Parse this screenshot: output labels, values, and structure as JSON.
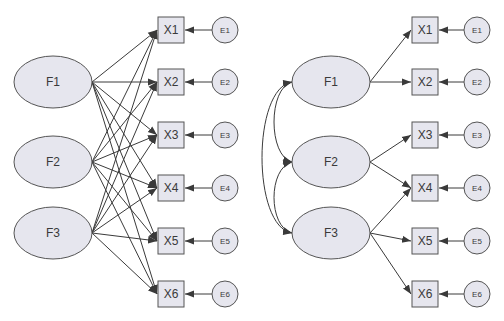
{
  "colors": {
    "background": "#ffffff",
    "node_fill": "#e6e6ee",
    "node_stroke": "#555555",
    "edge": "#3a3a3a",
    "text": "#3a3a3a"
  },
  "diagrams": [
    {
      "id": "left",
      "description": "Fully cross-loaded model: every factor points to every indicator",
      "factors": [
        {
          "label": "F1",
          "cx": 53,
          "cy": 82
        },
        {
          "label": "F2",
          "cx": 53,
          "cy": 162
        },
        {
          "label": "F3",
          "cx": 53,
          "cy": 233
        }
      ],
      "indicators": [
        {
          "label": "X1",
          "x": 158,
          "cy": 30
        },
        {
          "label": "X2",
          "x": 158,
          "cy": 82
        },
        {
          "label": "X3",
          "x": 158,
          "cy": 135
        },
        {
          "label": "X4",
          "x": 158,
          "cy": 188
        },
        {
          "label": "X5",
          "x": 158,
          "cy": 241
        },
        {
          "label": "X6",
          "x": 158,
          "cy": 294
        }
      ],
      "errors": [
        {
          "label": "E1",
          "cx": 225,
          "cy": 30
        },
        {
          "label": "E2",
          "cx": 225,
          "cy": 82
        },
        {
          "label": "E3",
          "cx": 225,
          "cy": 135
        },
        {
          "label": "E4",
          "cx": 225,
          "cy": 188
        },
        {
          "label": "E5",
          "cx": 225,
          "cy": 241
        },
        {
          "label": "E6",
          "cx": 225,
          "cy": 294
        }
      ],
      "loadings": [
        [
          "F1",
          "X1"
        ],
        [
          "F1",
          "X2"
        ],
        [
          "F1",
          "X3"
        ],
        [
          "F1",
          "X4"
        ],
        [
          "F1",
          "X5"
        ],
        [
          "F1",
          "X6"
        ],
        [
          "F2",
          "X1"
        ],
        [
          "F2",
          "X2"
        ],
        [
          "F2",
          "X3"
        ],
        [
          "F2",
          "X4"
        ],
        [
          "F2",
          "X5"
        ],
        [
          "F2",
          "X6"
        ],
        [
          "F3",
          "X1"
        ],
        [
          "F3",
          "X2"
        ],
        [
          "F3",
          "X3"
        ],
        [
          "F3",
          "X4"
        ],
        [
          "F3",
          "X5"
        ],
        [
          "F3",
          "X6"
        ]
      ],
      "covariances": []
    },
    {
      "id": "right",
      "description": "Simple-structure model with correlated factors",
      "factors": [
        {
          "label": "F1",
          "cx": 331,
          "cy": 82
        },
        {
          "label": "F2",
          "cx": 331,
          "cy": 162
        },
        {
          "label": "F3",
          "cx": 331,
          "cy": 233
        }
      ],
      "indicators": [
        {
          "label": "X1",
          "x": 412,
          "cy": 30
        },
        {
          "label": "X2",
          "x": 412,
          "cy": 82
        },
        {
          "label": "X3",
          "x": 412,
          "cy": 135
        },
        {
          "label": "X4",
          "x": 412,
          "cy": 188
        },
        {
          "label": "X5",
          "x": 412,
          "cy": 241
        },
        {
          "label": "X6",
          "x": 412,
          "cy": 294
        }
      ],
      "errors": [
        {
          "label": "E1",
          "cx": 477,
          "cy": 30
        },
        {
          "label": "E2",
          "cx": 477,
          "cy": 82
        },
        {
          "label": "E3",
          "cx": 477,
          "cy": 135
        },
        {
          "label": "E4",
          "cx": 477,
          "cy": 188
        },
        {
          "label": "E5",
          "cx": 477,
          "cy": 241
        },
        {
          "label": "E6",
          "cx": 477,
          "cy": 294
        }
      ],
      "loadings": [
        [
          "F1",
          "X1"
        ],
        [
          "F1",
          "X2"
        ],
        [
          "F2",
          "X3"
        ],
        [
          "F2",
          "X4"
        ],
        [
          "F3",
          "X4"
        ],
        [
          "F3",
          "X5"
        ],
        [
          "F3",
          "X6"
        ]
      ],
      "covariances": [
        [
          "F1",
          "F2"
        ],
        [
          "F2",
          "F3"
        ],
        [
          "F1",
          "F3"
        ]
      ]
    }
  ],
  "geometry": {
    "factor_rx": 39,
    "factor_ry": 26,
    "box_size": 26,
    "error_r": 13
  }
}
